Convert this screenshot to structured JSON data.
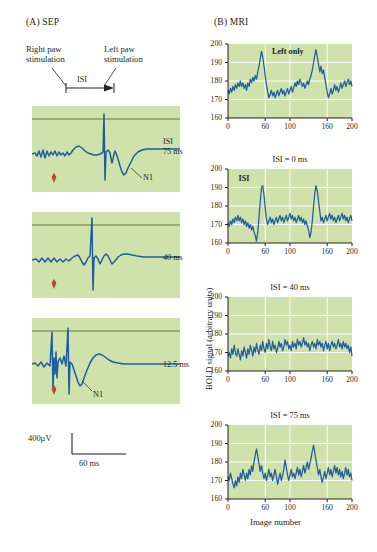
{
  "figure": {
    "panel_a_label": "(A)  SEP",
    "panel_b_label": "(B)  MRI"
  },
  "panel_a": {
    "stim_left_label": "Right paw\nstimulation",
    "stim_left_line1": "Right paw",
    "stim_left_line2": "stimulation",
    "stim_right_line1": "Left paw",
    "stim_right_line2": "stimulation",
    "isi_bracket_label": "ISI",
    "traces": [
      {
        "label_line1": "ISI",
        "label_line2": "75 ms",
        "n1_label": "N1",
        "isi_ms": 75
      },
      {
        "label_line1": "",
        "label_line2": "40 ms",
        "n1_label": "",
        "isi_ms": 40
      },
      {
        "label_line1": "",
        "label_line2": "12.5 ms",
        "n1_label": "N1",
        "isi_ms": 12.5
      }
    ],
    "scale_vertical": "400µV",
    "scale_horizontal": "60 ms"
  },
  "panel_b": {
    "ylabel": "BOLD signal (arbitrary units)",
    "xlabel": "Image number",
    "yticks": [
      "200",
      "190",
      "180",
      "170",
      "160"
    ],
    "xticks": [
      "0",
      "60",
      "100",
      "160",
      "200"
    ],
    "xtick_values": [
      0,
      60,
      100,
      160,
      200
    ]
  },
  "colors": {
    "plot_background": "#cfe2ac",
    "trace": "#1f5e9e",
    "gridline": "#ffffff",
    "text": "#231f20",
    "marker_arrow": "#b5472a"
  },
  "chart_data": [
    {
      "type": "line",
      "title": "Left only",
      "xlabel": "",
      "ylabel": "BOLD signal (arbitrary units)",
      "xlim": [
        0,
        200
      ],
      "ylim": [
        160,
        200
      ],
      "grid": true,
      "x": [
        0,
        2,
        4,
        6,
        8,
        10,
        12,
        14,
        16,
        18,
        20,
        22,
        24,
        26,
        28,
        30,
        32,
        34,
        36,
        38,
        40,
        42,
        44,
        46,
        48,
        50,
        52,
        54,
        56,
        58,
        60,
        62,
        64,
        66,
        68,
        70,
        72,
        74,
        76,
        78,
        80,
        82,
        84,
        86,
        88,
        90,
        92,
        94,
        96,
        98,
        100,
        102,
        104,
        106,
        108,
        110,
        112,
        114,
        116,
        118,
        120,
        122,
        124,
        126,
        128,
        130,
        132,
        134,
        136,
        138,
        140,
        142,
        144,
        146,
        148,
        150,
        152,
        154,
        156,
        158,
        160,
        162,
        164,
        166,
        168,
        170,
        172,
        174,
        176,
        178,
        180,
        182,
        184,
        186,
        188,
        190,
        192,
        194,
        196,
        198,
        200
      ],
      "values": [
        175,
        173,
        176,
        174,
        177,
        175,
        178,
        176,
        179,
        177,
        180,
        177,
        179,
        176,
        178,
        175,
        179,
        177,
        181,
        179,
        182,
        180,
        183,
        181,
        185,
        188,
        192,
        196,
        193,
        188,
        183,
        178,
        174,
        171,
        173,
        175,
        172,
        174,
        171,
        173,
        175,
        172,
        174,
        176,
        173,
        175,
        172,
        174,
        176,
        173,
        175,
        177,
        174,
        176,
        179,
        177,
        180,
        178,
        181,
        179,
        177,
        179,
        176,
        178,
        180,
        178,
        181,
        183,
        186,
        190,
        194,
        197,
        193,
        189,
        185,
        188,
        184,
        186,
        182,
        178,
        174,
        171,
        173,
        176,
        173,
        175,
        178,
        175,
        177,
        174,
        176,
        179,
        176,
        178,
        180,
        177,
        179,
        181,
        178,
        180,
        177
      ],
      "annotations": [
        {
          "text": "Left only",
          "x": 100,
          "y": 195
        }
      ]
    },
    {
      "type": "line",
      "title": "ISI = 0 ms",
      "xlabel": "",
      "ylabel": "BOLD signal (arbitrary units)",
      "xlim": [
        0,
        200
      ],
      "ylim": [
        160,
        200
      ],
      "grid": true,
      "x": [
        0,
        2,
        4,
        6,
        8,
        10,
        12,
        14,
        16,
        18,
        20,
        22,
        24,
        26,
        28,
        30,
        32,
        34,
        36,
        38,
        40,
        42,
        44,
        46,
        48,
        50,
        52,
        54,
        56,
        58,
        60,
        62,
        64,
        66,
        68,
        70,
        72,
        74,
        76,
        78,
        80,
        82,
        84,
        86,
        88,
        90,
        92,
        94,
        96,
        98,
        100,
        102,
        104,
        106,
        108,
        110,
        112,
        114,
        116,
        118,
        120,
        122,
        124,
        126,
        128,
        130,
        132,
        134,
        136,
        138,
        140,
        142,
        144,
        146,
        148,
        150,
        152,
        154,
        156,
        158,
        160,
        162,
        164,
        166,
        168,
        170,
        172,
        174,
        176,
        178,
        180,
        182,
        184,
        186,
        188,
        190,
        192,
        194,
        196,
        198,
        200
      ],
      "values": [
        171,
        169,
        172,
        170,
        173,
        171,
        174,
        172,
        175,
        172,
        174,
        171,
        173,
        170,
        172,
        169,
        171,
        168,
        170,
        167,
        169,
        166,
        164,
        161,
        166,
        174,
        182,
        190,
        191,
        186,
        179,
        173,
        170,
        172,
        174,
        171,
        173,
        170,
        172,
        174,
        171,
        173,
        175,
        172,
        174,
        171,
        173,
        175,
        172,
        174,
        176,
        173,
        175,
        172,
        174,
        171,
        173,
        175,
        172,
        174,
        171,
        173,
        170,
        172,
        169,
        167,
        163,
        166,
        172,
        180,
        187,
        191,
        188,
        183,
        177,
        172,
        174,
        171,
        173,
        175,
        172,
        174,
        176,
        173,
        175,
        172,
        174,
        171,
        173,
        175,
        172,
        174,
        176,
        173,
        175,
        172,
        174,
        171,
        173,
        175,
        172
      ],
      "annotations": [
        {
          "text": "ISI",
          "x": 46,
          "y": 194
        }
      ]
    },
    {
      "type": "line",
      "title": "ISI = 40 ms",
      "xlabel": "",
      "ylabel": "BOLD signal (arbitrary units)",
      "xlim": [
        0,
        200
      ],
      "ylim": [
        160,
        200
      ],
      "grid": true,
      "x": [
        0,
        2,
        4,
        6,
        8,
        10,
        12,
        14,
        16,
        18,
        20,
        22,
        24,
        26,
        28,
        30,
        32,
        34,
        36,
        38,
        40,
        42,
        44,
        46,
        48,
        50,
        52,
        54,
        56,
        58,
        60,
        62,
        64,
        66,
        68,
        70,
        72,
        74,
        76,
        78,
        80,
        82,
        84,
        86,
        88,
        90,
        92,
        94,
        96,
        98,
        100,
        102,
        104,
        106,
        108,
        110,
        112,
        114,
        116,
        118,
        120,
        122,
        124,
        126,
        128,
        130,
        132,
        134,
        136,
        138,
        140,
        142,
        144,
        146,
        148,
        150,
        152,
        154,
        156,
        158,
        160,
        162,
        164,
        166,
        168,
        170,
        172,
        174,
        176,
        178,
        180,
        182,
        184,
        186,
        188,
        190,
        192,
        194,
        196,
        198,
        200
      ],
      "values": [
        168,
        170,
        167,
        172,
        169,
        174,
        170,
        168,
        172,
        169,
        166,
        171,
        168,
        173,
        170,
        167,
        172,
        169,
        174,
        171,
        168,
        173,
        170,
        175,
        171,
        169,
        174,
        171,
        176,
        172,
        170,
        175,
        172,
        177,
        173,
        171,
        176,
        172,
        174,
        170,
        172,
        176,
        173,
        175,
        171,
        173,
        177,
        174,
        176,
        172,
        174,
        171,
        176,
        173,
        175,
        172,
        177,
        174,
        176,
        173,
        175,
        178,
        174,
        176,
        173,
        175,
        171,
        174,
        176,
        173,
        175,
        172,
        177,
        174,
        176,
        173,
        175,
        171,
        174,
        176,
        172,
        175,
        171,
        174,
        176,
        173,
        175,
        172,
        174,
        177,
        173,
        175,
        172,
        176,
        173,
        175,
        172,
        174,
        170,
        173,
        168
      ],
      "annotations": []
    },
    {
      "type": "line",
      "title": "ISI = 75 ms",
      "xlabel": "Image number",
      "ylabel": "BOLD signal (arbitrary units)",
      "xlim": [
        0,
        200
      ],
      "ylim": [
        160,
        200
      ],
      "grid": true,
      "x": [
        0,
        2,
        4,
        6,
        8,
        10,
        12,
        14,
        16,
        18,
        20,
        22,
        24,
        26,
        28,
        30,
        32,
        34,
        36,
        38,
        40,
        42,
        44,
        46,
        48,
        50,
        52,
        54,
        56,
        58,
        60,
        62,
        64,
        66,
        68,
        70,
        72,
        74,
        76,
        78,
        80,
        82,
        84,
        86,
        88,
        90,
        92,
        94,
        96,
        98,
        100,
        102,
        104,
        106,
        108,
        110,
        112,
        114,
        116,
        118,
        120,
        122,
        124,
        126,
        128,
        130,
        132,
        134,
        136,
        138,
        140,
        142,
        144,
        146,
        148,
        150,
        152,
        154,
        156,
        158,
        160,
        162,
        164,
        166,
        168,
        170,
        172,
        174,
        176,
        178,
        180,
        182,
        184,
        186,
        188,
        190,
        192,
        194,
        196,
        198,
        200
      ],
      "values": [
        172,
        170,
        174,
        171,
        168,
        166,
        170,
        167,
        172,
        169,
        174,
        171,
        176,
        173,
        170,
        174,
        171,
        176,
        173,
        178,
        175,
        180,
        184,
        187,
        183,
        179,
        175,
        178,
        174,
        171,
        174,
        170,
        173,
        176,
        172,
        174,
        170,
        173,
        176,
        172,
        168,
        171,
        174,
        170,
        173,
        176,
        181,
        177,
        173,
        170,
        173,
        176,
        172,
        174,
        171,
        174,
        177,
        173,
        176,
        172,
        175,
        178,
        174,
        177,
        180,
        176,
        179,
        182,
        186,
        189,
        185,
        181,
        177,
        173,
        176,
        172,
        169,
        172,
        175,
        171,
        174,
        177,
        173,
        176,
        172,
        175,
        178,
        174,
        177,
        173,
        176,
        172,
        175,
        171,
        174,
        177,
        173,
        176,
        172,
        174,
        170
      ],
      "annotations": []
    }
  ]
}
